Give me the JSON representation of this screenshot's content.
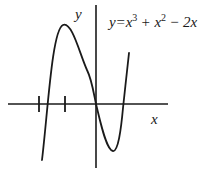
{
  "figure": {
    "equation": {
      "lhs": "y",
      "eq": "=",
      "t1_base": "x",
      "t1_exp": "3",
      "op1": "+",
      "t2_base": "x",
      "t2_exp": "2",
      "op2": "−",
      "t3": "2x"
    },
    "x_axis_label": "x",
    "y_axis_label": "y",
    "colors": {
      "stroke": "#1a1a1a",
      "background": "#ffffff"
    },
    "curve_description": "Sketch of cubic y = x^3 + x^2 - 2x with local max left of y-axis, passing through origin, local min right of y-axis, rising to the right",
    "tick_marks_on_x_axis": 2
  }
}
